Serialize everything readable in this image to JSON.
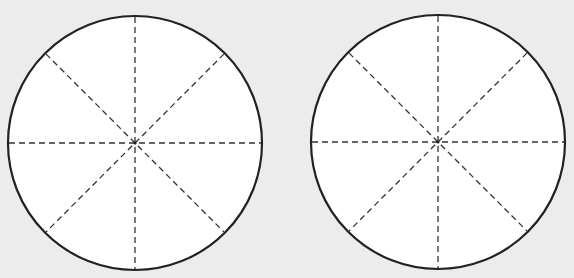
{
  "diagram": {
    "background": "#ececec",
    "stroke_color": "#222222",
    "dash_color": "#333333",
    "fill_color": "#ffffff",
    "circles": [
      {
        "name": "left-circle",
        "cx": 135,
        "cy": 143,
        "r": 127,
        "divisions": 8
      },
      {
        "name": "right-circle",
        "cx": 438,
        "cy": 142,
        "r": 127,
        "divisions": 8
      }
    ]
  }
}
